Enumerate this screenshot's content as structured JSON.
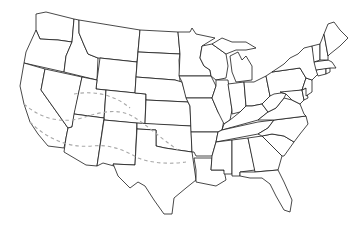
{
  "map": {
    "type": "outline-map",
    "region": "Contiguous United States",
    "background_color": "#ffffff",
    "border_color": "#1a1a1a",
    "overlay": {
      "style": "dashed",
      "color": "#a8a8a8",
      "description": "Two dashed bands across the southwestern US (California, Nevada, Arizona, Utah, New Mexico, Colorado, Texas)"
    },
    "labels": []
  }
}
